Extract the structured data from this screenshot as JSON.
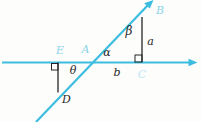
{
  "diagram": {
    "points": {
      "E": "E",
      "A": "A",
      "B": "B",
      "C": "C",
      "D": "D"
    },
    "angles": {
      "theta": "θ",
      "alpha": "α",
      "beta": "β"
    },
    "segments": {
      "a": "a",
      "b": "b"
    },
    "colors": {
      "line": "#3cbde0",
      "point_label": "#8bd3e8",
      "point_label_faint": "#bce6f2",
      "dark": "#272727",
      "background": "#fdfdfc"
    }
  }
}
